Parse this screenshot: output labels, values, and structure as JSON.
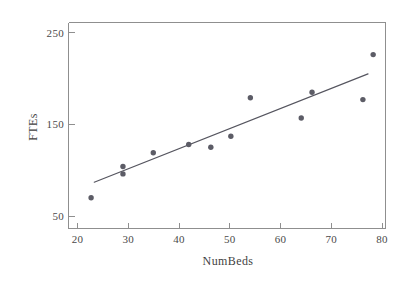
{
  "chart_data": {
    "type": "scatter",
    "title": "",
    "xlabel": "NumBeds",
    "ylabel": "FTEs",
    "xlim": [
      18.8,
      80.5
    ],
    "ylim": [
      37.5,
      262
    ],
    "grid": false,
    "legend": "none",
    "xticks": [
      20,
      30,
      40,
      50,
      60,
      70,
      80
    ],
    "xtick_labels": [
      "20",
      "30",
      "40",
      "50",
      "60",
      "70",
      "80"
    ],
    "yticks": [
      50,
      150,
      250
    ],
    "ytick_labels": [
      "50",
      "150",
      "250"
    ],
    "marker_color": "#5c5c66",
    "line_color": "#55555f",
    "axis_color": "#8a8a8a",
    "points": [
      {
        "x": 23.2,
        "y": 71
      },
      {
        "x": 29.4,
        "y": 105
      },
      {
        "x": 29.4,
        "y": 97
      },
      {
        "x": 35.3,
        "y": 120
      },
      {
        "x": 42.2,
        "y": 129
      },
      {
        "x": 46.5,
        "y": 126
      },
      {
        "x": 50.4,
        "y": 138
      },
      {
        "x": 54.2,
        "y": 180
      },
      {
        "x": 64.1,
        "y": 158
      },
      {
        "x": 66.2,
        "y": 186
      },
      {
        "x": 76.1,
        "y": 178
      },
      {
        "x": 78.1,
        "y": 227
      }
    ],
    "fit_line": {
      "name": "least-squares fit",
      "x_start": 23.8,
      "y_start": 88,
      "x_end": 77.1,
      "y_end": 206
    }
  }
}
